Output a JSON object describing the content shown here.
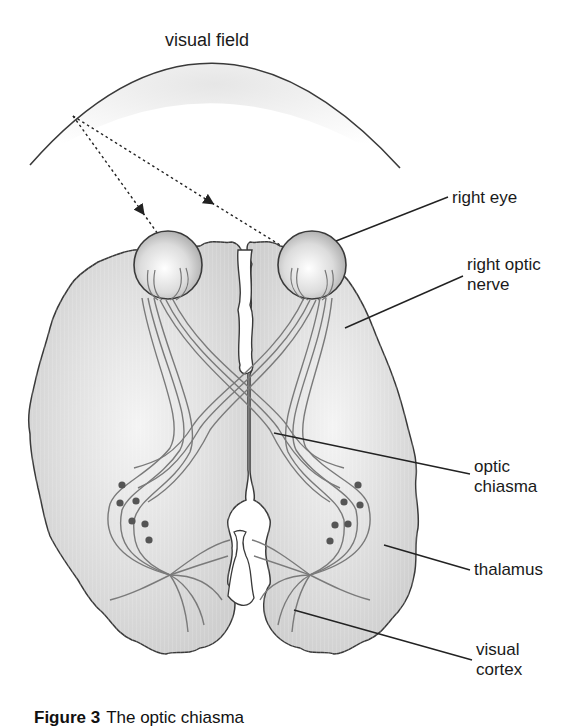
{
  "diagram": {
    "title": "visual field",
    "labels": {
      "right_eye": "right eye",
      "right_optic_nerve_line1": "right optic",
      "right_optic_nerve_line2": "nerve",
      "optic_chiasma_line1": "optic",
      "optic_chiasma_line2": "chiasma",
      "thalamus": "thalamus",
      "visual_cortex_line1": "visual",
      "visual_cortex_line2": "cortex"
    },
    "caption": {
      "prefix": "Figure 3",
      "text": "The optic chiasma"
    },
    "colors": {
      "outline": "#3a3a3a",
      "brain_fill": "#d9d9d9",
      "fiber": "#7a7a7a",
      "neuron": "#555555",
      "leader_line": "#222222"
    }
  }
}
